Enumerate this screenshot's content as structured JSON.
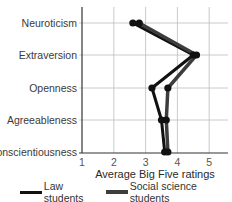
{
  "chart_data": {
    "type": "line",
    "orientation": "horizontal",
    "title": "",
    "xlabel": "Average Big Five ratings",
    "ylabel": "",
    "xlim": [
      1,
      5.5
    ],
    "x_ticks": [
      "1",
      "2",
      "3",
      "4",
      "5"
    ],
    "categories": [
      "Neuroticism",
      "Extraversion",
      "Openness",
      "Agreeableness",
      "Conscientiousness"
    ],
    "grid": true,
    "legend_position": "bottom",
    "series": [
      {
        "name": "Law students",
        "color": "#111111",
        "values": [
          2.6,
          4.5,
          3.2,
          3.5,
          3.6
        ]
      },
      {
        "name": "Social science students",
        "color": "#3d3d3d",
        "values": [
          2.8,
          4.6,
          3.7,
          3.65,
          3.7
        ]
      }
    ]
  },
  "legend": {
    "items": [
      {
        "label": "Law students",
        "color": "#111111"
      },
      {
        "label": "Social science students",
        "color": "#3d3d3d"
      }
    ]
  }
}
